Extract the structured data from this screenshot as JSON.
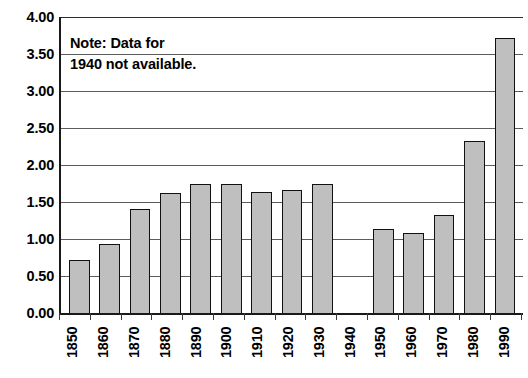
{
  "chart_data": {
    "type": "bar",
    "title": "",
    "subtitle": "",
    "xlabel": "",
    "ylabel": "",
    "categories": [
      "1850",
      "1860",
      "1870",
      "1880",
      "1890",
      "1900",
      "1910",
      "1920",
      "1930",
      "1940",
      "1950",
      "1960",
      "1970",
      "1980",
      "1990"
    ],
    "values": [
      0.72,
      0.93,
      1.4,
      1.62,
      1.74,
      1.74,
      1.64,
      1.66,
      1.74,
      null,
      1.13,
      1.08,
      1.33,
      2.33,
      3.72
    ],
    "ylim": [
      0.0,
      4.0
    ],
    "ytick_values": [
      0.0,
      0.5,
      1.0,
      1.5,
      2.0,
      2.5,
      3.0,
      3.5,
      4.0
    ],
    "ytick_labels": [
      "0.00",
      "0.50",
      "1.00",
      "1.50",
      "2.00",
      "2.50",
      "3.00",
      "3.50",
      "4.00"
    ],
    "grid": true,
    "legend": false,
    "annotations": [
      {
        "name": "missing-data-note",
        "text": "Note: Data for\n1940 not available."
      }
    ],
    "missing_categories": [
      "1940"
    ],
    "colors": {
      "bar_fill": "#bfbfbf",
      "bar_edge": "#111111",
      "gridline": "#5c5c5c",
      "axis": "#1a1a1a",
      "background": "#ffffff",
      "text": "#000000"
    }
  }
}
